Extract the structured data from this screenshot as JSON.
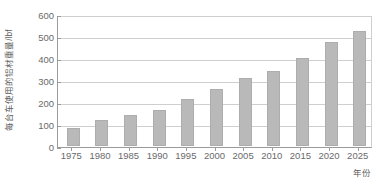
{
  "chart_data": {
    "type": "bar",
    "title": "",
    "subtitle": "",
    "xlabel": "年份",
    "ylabel": "每台车使用的铝材重量/lbf",
    "categories": [
      "1975",
      "1980",
      "1985",
      "1990",
      "1995",
      "2000",
      "2005",
      "2010",
      "2015",
      "2020",
      "2025"
    ],
    "values": [
      82,
      117,
      140,
      165,
      212,
      258,
      310,
      340,
      400,
      475,
      525
    ],
    "series": [
      {
        "name": "每台车使用的铝材重量",
        "values": [
          82,
          117,
          140,
          165,
          212,
          258,
          310,
          340,
          400,
          475,
          525
        ]
      }
    ],
    "ylim": [
      0,
      600
    ],
    "yticks": [
      0,
      100,
      200,
      300,
      400,
      500,
      600
    ],
    "ytick_labels": [
      "0",
      "100",
      "200",
      "300",
      "400",
      "500",
      "600"
    ],
    "grid": true,
    "grid_axis": "y",
    "legend": false,
    "legend_position": "none",
    "bar_color": "#b9b9b9",
    "bar_edge_color": "#adadad",
    "axis_color": "#9b9b9b",
    "grid_color": "#cfcfcf",
    "tick_label_color": "#6a6a6a",
    "axis_title_color": "#5d5d5d",
    "background_color": "#ffffff"
  }
}
